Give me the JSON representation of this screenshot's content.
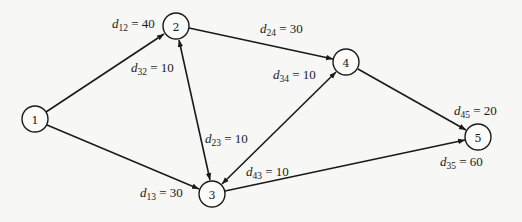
{
  "diagram": {
    "type": "directed-network",
    "nodes": [
      {
        "id": "1",
        "label": "1",
        "x": 35,
        "y": 119
      },
      {
        "id": "2",
        "label": "2",
        "x": 176,
        "y": 26
      },
      {
        "id": "3",
        "label": "3",
        "x": 212,
        "y": 194
      },
      {
        "id": "4",
        "label": "4",
        "x": 346,
        "y": 62
      },
      {
        "id": "5",
        "label": "5",
        "x": 478,
        "y": 137
      }
    ],
    "edges": [
      {
        "from": "1",
        "to": "2",
        "var": "d",
        "sub": "12",
        "value": "40"
      },
      {
        "from": "1",
        "to": "3",
        "var": "d",
        "sub": "13",
        "value": "30"
      },
      {
        "from": "2",
        "to": "4",
        "var": "d",
        "sub": "24",
        "value": "30"
      },
      {
        "from": "3",
        "to": "2",
        "var": "d",
        "sub": "32",
        "value": "10"
      },
      {
        "from": "2",
        "to": "3",
        "var": "d",
        "sub": "23",
        "value": "10"
      },
      {
        "from": "3",
        "to": "4",
        "var": "d",
        "sub": "34",
        "value": "10"
      },
      {
        "from": "4",
        "to": "3",
        "var": "d",
        "sub": "43",
        "value": "10"
      },
      {
        "from": "4",
        "to": "5",
        "var": "d",
        "sub": "45",
        "value": "20"
      },
      {
        "from": "3",
        "to": "5",
        "var": "d",
        "sub": "35",
        "value": "60"
      }
    ],
    "labels": {
      "d12": {
        "var": "d",
        "sub": "12",
        "eq": " = 40"
      },
      "d32": {
        "var": "d",
        "sub": "32",
        "eq": " = 10"
      },
      "d24": {
        "var": "d",
        "sub": "24",
        "eq": " = 30"
      },
      "d34": {
        "var": "d",
        "sub": "34",
        "eq": " = 10"
      },
      "d23": {
        "var": "d",
        "sub": "23",
        "eq": " = 10"
      },
      "d43": {
        "var": "d",
        "sub": "43",
        "eq": " = 10"
      },
      "d13": {
        "var": "d",
        "sub": "13",
        "eq": " = 30"
      },
      "d45": {
        "var": "d",
        "sub": "45",
        "eq": " = 20"
      },
      "d35": {
        "var": "d",
        "sub": "35",
        "eq": " = 60"
      }
    },
    "node_labels": {
      "n1": "1",
      "n2": "2",
      "n3": "3",
      "n4": "4",
      "n5": "5"
    }
  }
}
